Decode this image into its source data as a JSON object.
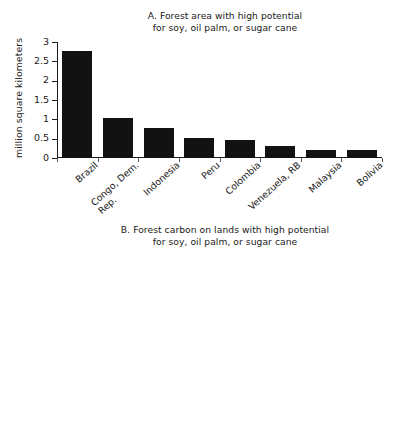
{
  "figure": {
    "background_color": "#ffffff",
    "bar_color": "#121212",
    "axis_color": "#1a1a1a"
  },
  "panels": {
    "a": {
      "title": "A. Forest area with high potential\nfor soy, oil palm, or sugar cane",
      "ylabel": "million square kilometers",
      "yticks": [
        "0",
        "0.5",
        "1",
        "1.5",
        "2",
        "2.5",
        "3"
      ]
    },
    "b": {
      "title": "B. Forest carbon on lands with high potential\nfor soy, oil palm, or sugar cane",
      "ylabel": "billion tons of carbon",
      "yticks": [
        "0",
        "10",
        "20",
        "30",
        "40",
        "50",
        "60"
      ]
    }
  },
  "categories": [
    "Brazil",
    "Congo, Dem.\nRep.",
    "Indonesia",
    "Peru",
    "Colombia",
    "Venezuela, RB",
    "Malaysia",
    "Bolivia"
  ],
  "chart_data": [
    {
      "type": "bar",
      "title": "A. Forest area with high potential for soy, oil palm, or sugar cane",
      "xlabel": "",
      "ylabel": "million square kilometers",
      "categories": [
        "Brazil",
        "Congo, Dem. Rep.",
        "Indonesia",
        "Peru",
        "Colombia",
        "Venezuela, RB",
        "Malaysia",
        "Bolivia"
      ],
      "values": [
        2.78,
        1.03,
        0.77,
        0.53,
        0.47,
        0.3,
        0.22,
        0.21
      ],
      "ylim": [
        0,
        3
      ],
      "yticks": [
        0,
        0.5,
        1,
        1.5,
        2,
        2.5,
        3
      ],
      "grid": false,
      "legend": false
    },
    {
      "type": "bar",
      "title": "B. Forest carbon on lands with high potential for soy, oil palm, or sugar cane",
      "xlabel": "",
      "ylabel": "billion tons of carbon",
      "categories": [
        "Brazil",
        "Congo, Dem. Rep.",
        "Indonesia",
        "Peru",
        "Colombia",
        "Venezuela, RB",
        "Malaysia",
        "Bolivia"
      ],
      "values": [
        50.3,
        16.2,
        11.5,
        9.6,
        8.3,
        4.4,
        3.1,
        4.0
      ],
      "ylim": [
        0,
        60
      ],
      "yticks": [
        0,
        10,
        20,
        30,
        40,
        50,
        60
      ],
      "grid": false,
      "legend": false
    }
  ]
}
